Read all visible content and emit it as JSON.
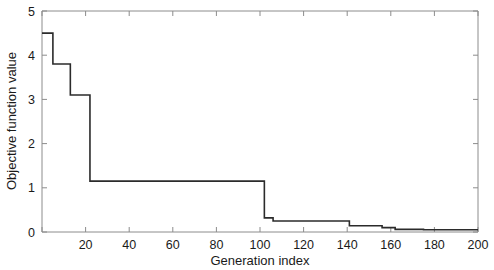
{
  "chart_data": {
    "type": "line",
    "title": "",
    "xlabel": "Generation index",
    "ylabel": "Objective function value",
    "xlim": [
      0,
      200
    ],
    "ylim": [
      0,
      5
    ],
    "xticks": [
      0,
      20,
      40,
      60,
      80,
      100,
      120,
      140,
      160,
      180,
      200
    ],
    "xtick_labels": [
      "",
      "20",
      "40",
      "60",
      "80",
      "100",
      "120",
      "140",
      "160",
      "180",
      "200"
    ],
    "yticks": [
      0,
      1,
      2,
      3,
      4,
      5
    ],
    "ytick_labels": [
      "0",
      "1",
      "2",
      "3",
      "4",
      "5"
    ],
    "grid": false,
    "legend": null,
    "line_color": "#2b2b2b",
    "axis_color": "#8c8c8c",
    "drawstyle": "steps-post",
    "series": [
      {
        "name": "Best objective function value",
        "x": [
          0,
          5,
          5,
          13,
          13,
          22,
          22,
          102,
          102,
          106,
          106,
          141,
          141,
          156,
          156,
          162,
          162,
          175,
          175,
          200
        ],
        "y": [
          4.5,
          4.5,
          3.8,
          3.8,
          3.1,
          3.1,
          1.15,
          1.15,
          0.32,
          0.32,
          0.25,
          0.25,
          0.14,
          0.14,
          0.1,
          0.1,
          0.06,
          0.06,
          0.05,
          0.05
        ]
      }
    ],
    "steps": [
      {
        "generation": 0,
        "value": 4.5
      },
      {
        "generation": 5,
        "value": 3.8
      },
      {
        "generation": 13,
        "value": 3.1
      },
      {
        "generation": 22,
        "value": 1.15
      },
      {
        "generation": 102,
        "value": 0.32
      },
      {
        "generation": 106,
        "value": 0.25
      },
      {
        "generation": 141,
        "value": 0.14
      },
      {
        "generation": 156,
        "value": 0.1
      },
      {
        "generation": 162,
        "value": 0.06
      },
      {
        "generation": 175,
        "value": 0.05
      }
    ]
  }
}
